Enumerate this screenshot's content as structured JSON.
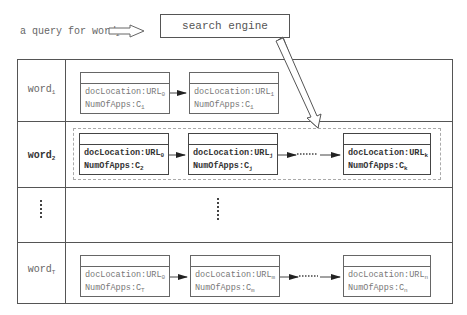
{
  "query": {
    "text": "a query for word",
    "subscript": "2"
  },
  "search_engine": {
    "label": "search engine"
  },
  "rows": [
    {
      "label": "word",
      "sub": "1",
      "bold": false,
      "nodes": [
        {
          "loc": "docLocation:URL",
          "loc_sub": "0",
          "num": "NumOfApps:C",
          "num_sub": "1"
        },
        {
          "loc": "docLocation:URL",
          "loc_sub": "1",
          "num": "NumOfApps:C",
          "num_sub": "1"
        }
      ]
    },
    {
      "label": "word",
      "sub": "2",
      "bold": true,
      "nodes": [
        {
          "loc": "docLocation:URL",
          "loc_sub": "0",
          "num": "NumOfApps:C",
          "num_sub": "2"
        },
        {
          "loc": "docLocation:URL",
          "loc_sub": "j",
          "num": "NumOfApps:C",
          "num_sub": "j"
        },
        {
          "loc": "docLocation:URL",
          "loc_sub": "k",
          "num": "NumOfApps:C",
          "num_sub": "k"
        }
      ],
      "ellipsis": "......"
    },
    {
      "label": "......",
      "ellipsis_row": true
    },
    {
      "label": "word",
      "sub": "T",
      "bold": false,
      "nodes": [
        {
          "loc": "docLocation:URL",
          "loc_sub": "0",
          "num": "NumOfApps:C",
          "num_sub": "T"
        },
        {
          "loc": "docLocation:URL",
          "loc_sub": "m",
          "num": "NumOfApps:C",
          "num_sub": "m"
        },
        {
          "loc": "docLocation:URL",
          "loc_sub": "n",
          "num": "NumOfApps:C",
          "num_sub": "n"
        }
      ],
      "ellipsis": "......"
    }
  ]
}
